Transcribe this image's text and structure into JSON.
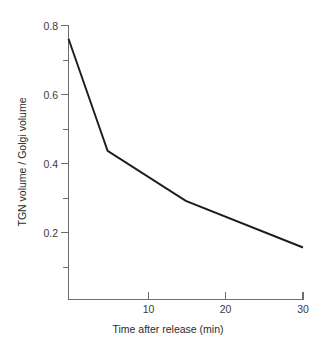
{
  "chart_data": {
    "type": "line",
    "title": "",
    "xlabel": "Time after release (min)",
    "ylabel": "TGN volume / Golgi volume",
    "xlim": [
      0,
      31.5
    ],
    "ylim": [
      0,
      0.82
    ],
    "grid": false,
    "legend": null,
    "x": [
      0,
      5,
      15,
      30
    ],
    "values": [
      0.76,
      0.435,
      0.29,
      0.155
    ],
    "series": [
      {
        "name": "TGN volume / Golgi volume",
        "color": "#1c1c1c",
        "points": [
          {
            "x": 0,
            "y": 0.76
          },
          {
            "x": 5,
            "y": 0.435
          },
          {
            "x": 15,
            "y": 0.29
          },
          {
            "x": 30,
            "y": 0.155
          }
        ]
      }
    ],
    "xticks": [
      {
        "value": 10,
        "label": "10",
        "major": true
      },
      {
        "value": 20,
        "label": "20",
        "major": true
      },
      {
        "value": 30,
        "label": "30",
        "major": true
      }
    ],
    "yticks": [
      {
        "value": 0.8,
        "label": "0.8",
        "major": true
      },
      {
        "value": 0.7,
        "label": "",
        "major": false
      },
      {
        "value": 0.6,
        "label": "0.6",
        "major": true
      },
      {
        "value": 0.5,
        "label": "",
        "major": false
      },
      {
        "value": 0.4,
        "label": "0.4",
        "major": true
      },
      {
        "value": 0.3,
        "label": "",
        "major": false
      },
      {
        "value": 0.2,
        "label": "0.2",
        "major": true
      },
      {
        "value": 0.1,
        "label": "",
        "major": false
      }
    ]
  },
  "axes": {
    "x_title": "Time after release (min)",
    "y_title": "TGN volume / Golgi volume"
  },
  "ticklabels": {
    "y": {
      "t08": "0.8",
      "t06": "0.6",
      "t04": "0.4",
      "t02": "0.2"
    },
    "x": {
      "t10": "10",
      "t20": "20",
      "t30": "30"
    }
  },
  "colors": {
    "line": "#1c1c1c",
    "axis": "#6e6e6e",
    "text": "#2b2b2b",
    "background": "#ffffff"
  }
}
